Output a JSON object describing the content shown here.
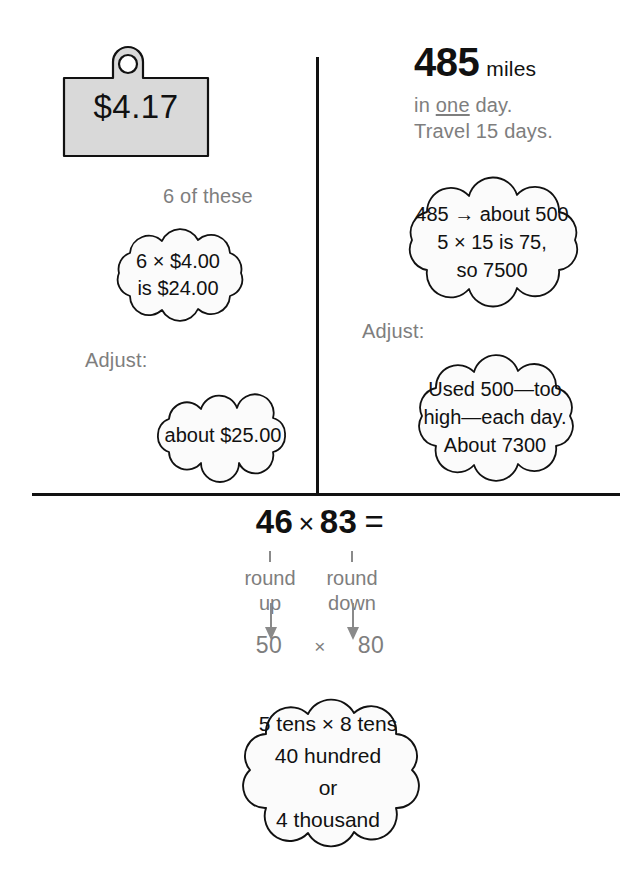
{
  "page": {
    "background": "#ffffff",
    "ink_color": "#111111",
    "gray_color": "#808080"
  },
  "left_panel": {
    "price_tag": {
      "value": "$4.17",
      "fill_color": "#d9d9d9",
      "outline_color": "#111111"
    },
    "quantity_label": "6 of these",
    "estimate_cloud": {
      "lines": [
        "6 × $4.00",
        "is $24.00"
      ]
    },
    "adjust_label": "Adjust:",
    "adjusted_cloud": {
      "lines": [
        "about $25.00"
      ]
    }
  },
  "right_panel": {
    "headline": {
      "number": "485",
      "unit": "miles",
      "line2_before": "in ",
      "line2_underlined": "one",
      "line2_after": " day.",
      "line3": "Travel 15 days."
    },
    "estimate_cloud": {
      "lines": [
        "485 → about 500",
        "5 × 15 is 75,",
        "so 7500"
      ]
    },
    "adjust_label": "Adjust:",
    "adjusted_cloud": {
      "lines": [
        "Used 500—too",
        "high—each day.",
        "About 7300"
      ]
    }
  },
  "bottom_panel": {
    "equation": {
      "left_factor": "46",
      "operator": "×",
      "right_factor": "83",
      "equals": "="
    },
    "columns": [
      {
        "tick": "|",
        "line1": "round",
        "line2": "up",
        "rounded_value": "50"
      },
      {
        "tick": "|",
        "line1": "round",
        "line2": "down",
        "rounded_value": "80"
      }
    ],
    "product_operator": "×",
    "result_cloud": {
      "lines": [
        "5 tens × 8 tens",
        "40 hundred",
        "or",
        "4 thousand"
      ]
    }
  }
}
